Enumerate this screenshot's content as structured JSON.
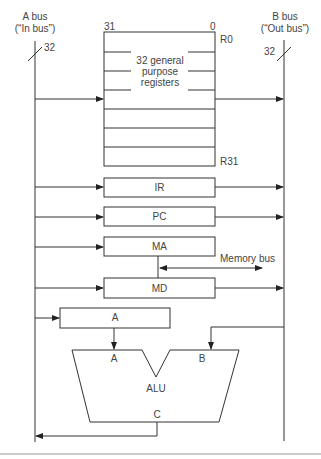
{
  "a_bus": {
    "title": "A bus",
    "subtitle": "(“In bus”)",
    "width": "32"
  },
  "b_bus": {
    "title": "B bus",
    "subtitle": "(“Out bus”)",
    "width": "32"
  },
  "register_file": {
    "msb": "31",
    "lsb": "0",
    "first": "R0",
    "last": "R31",
    "desc_line1": "32 general",
    "desc_line2": "purpose",
    "desc_line3": "registers"
  },
  "registers": {
    "ir": "IR",
    "pc": "PC",
    "ma": "MA",
    "md": "MD",
    "a": "A"
  },
  "memory_bus": "Memory bus",
  "alu": {
    "label": "ALU",
    "in_a": "A",
    "in_b": "B",
    "out_c": "C"
  },
  "colors": {
    "line": "#333333",
    "background": "#ffffff",
    "divider": "#999999"
  }
}
